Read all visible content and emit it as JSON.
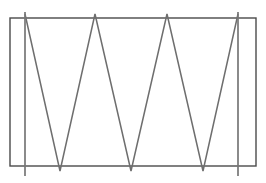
{
  "figure": {
    "type": "line-drawing",
    "canvas": {
      "width": 266,
      "height": 183
    },
    "background_color": "#ffffff",
    "colors": {
      "frame_stroke": "#4a4a4a",
      "zigzag_stroke": "#6e6e6e",
      "vertical_stroke": "#767676"
    },
    "stroke_widths": {
      "frame": 1.4,
      "zigzag": 1.5,
      "vertical": 1.7
    },
    "rectangle": {
      "label": "outer-rectangle",
      "x": 10,
      "y": 18,
      "width": 246,
      "height": 148,
      "left": 10,
      "top": 18,
      "right": 256,
      "bottom": 166
    },
    "zigzag": {
      "label": "zigzag-truss",
      "top_y": 14,
      "bottom_y": 171,
      "top_vertex_count": 4,
      "bottom_vertex_count": 3,
      "top_vertices_x": [
        25,
        95,
        167,
        238
      ],
      "bottom_vertices_x": [
        60,
        131,
        203
      ],
      "points": "25,14 60,171 95,14 131,171 167,14 203,171 238,14"
    },
    "zigzag_return": {
      "label": "zigzag-return-strand",
      "points": "25,171 60,14 95,171 131,14 167,171 203,14 238,171",
      "visible": false
    },
    "vertical_members": [
      {
        "label": "vertical-member-left",
        "x": 25,
        "y_top": 12,
        "y_bottom": 176
      },
      {
        "label": "vertical-member-right",
        "x": 238,
        "y_top": 12,
        "y_bottom": 176
      }
    ],
    "apex_overhang_px": 4,
    "vertex_undershoot_px": 5
  }
}
